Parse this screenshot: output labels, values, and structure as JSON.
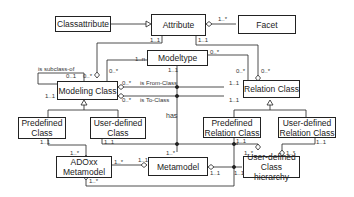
{
  "classes": {
    "classattribute": "Classattribute",
    "attribute": "Attribute",
    "facet": "Facet",
    "modeltype": "Modeltype",
    "modeling_class": "Modeling Class",
    "relation_class": "Relation Class",
    "predefined_class": "Predefined Class",
    "user_defined_class": "User-defined Class",
    "predefined_relation_class": "Predefined Relation Class",
    "user_defined_relation_class": "User-defined Relation Class",
    "adoxx_metamodel": "ADOxx Metamodel",
    "metamodel": "Metamodel",
    "user_defined_class_hierarchy": "User-defined Class hierarchy"
  },
  "labels": {
    "is_subclass_of": "is subclass-of",
    "is_from_class": "is From-Class",
    "is_to_class": "is To-Class",
    "has": "has"
  },
  "multiplicities": {
    "attr_facet": "1..*",
    "attr_left": "1..1",
    "attr_right": "1..1",
    "mt_left": "1..n",
    "mt_right": "0..*",
    "mt_bottom": "1..1",
    "mc_top_left": "0..*",
    "mc_top": "0..*",
    "mc_sub_top": "0..1",
    "mc_sub_bottom": "1..1",
    "mc_from": "0..*",
    "mc_to": "0..*",
    "rc_top_left": "0..*",
    "rc_top": "0..*",
    "rc_from": "1..1",
    "rc_to": "1..1",
    "pc_bottom": "1..1",
    "udc_bottom": "1..1",
    "prc_bottom": "1..1",
    "udrc_bottom": "1..1",
    "adoxx_top": "1..*",
    "adoxx_right": "1..*",
    "adoxx_bottom": "1..*",
    "mm_left": "1..1",
    "mm_top": "1..*",
    "mm_right": "1..1",
    "udch_left": "1..1",
    "udch_top_left": "1..*",
    "udch_top_right": "1..*"
  }
}
